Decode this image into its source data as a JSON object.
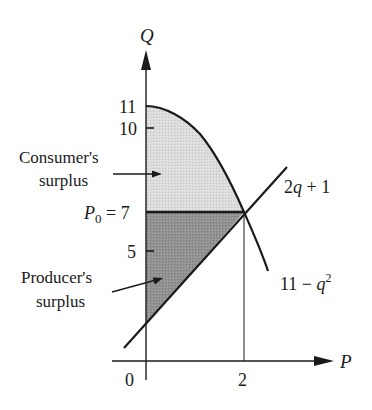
{
  "diagram": {
    "type": "supply-demand surplus diagram",
    "axes": {
      "vertical_label": "Q",
      "horizontal_label": "P",
      "vertical_ticks": [
        "11",
        "10",
        "5"
      ],
      "equilibrium_label": {
        "symbol": "P",
        "subscript": "0",
        "rest": " = 7"
      },
      "horizontal_ticks": [
        "0",
        "2"
      ]
    },
    "curves": {
      "supply": {
        "label_main": "2q + 1",
        "text": "2q + 1"
      },
      "demand": {
        "label_main": "11 − q",
        "superscript": "2",
        "text": "11 − q²"
      }
    },
    "regions": {
      "consumer": {
        "line1": "Consumer's",
        "line2": "surplus",
        "fill": "#d9d9d9"
      },
      "producer": {
        "line1": "Producer's",
        "line2": "surplus",
        "fill": "#8f8f8f"
      }
    },
    "colors": {
      "ink": "#1a1a1a",
      "background": "#ffffff"
    }
  }
}
